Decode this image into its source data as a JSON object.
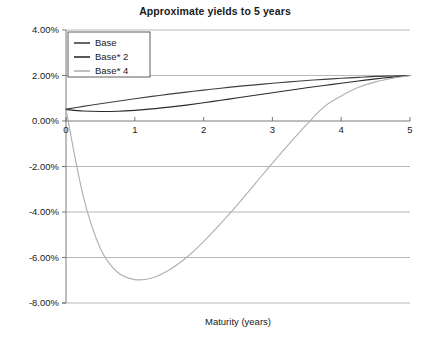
{
  "chart_data": {
    "type": "line",
    "title": "Approximate yields to 5 years",
    "xlabel": "Maturity (years)",
    "ylabel": "",
    "xlim": [
      0,
      5
    ],
    "ylim": [
      -0.08,
      0.04
    ],
    "grid": true,
    "legend_position": "top-left",
    "x_ticks": [
      "0",
      "1",
      "2",
      "3",
      "4",
      "5"
    ],
    "x_tick_values": [
      0,
      1,
      2,
      3,
      4,
      5
    ],
    "y_ticks": [
      "4.00%",
      "2.00%",
      "0.00%",
      "-2.00%",
      "-4.00%",
      "-6.00%",
      "-8.00%"
    ],
    "y_tick_values": [
      0.04,
      0.02,
      0.0,
      -0.02,
      -0.04,
      -0.06,
      -0.08
    ],
    "x": [
      0,
      0.25,
      0.5,
      0.75,
      1,
      1.25,
      1.5,
      1.75,
      2,
      2.25,
      2.5,
      2.75,
      3,
      3.25,
      3.5,
      3.75,
      4,
      4.25,
      4.5,
      4.75,
      5
    ],
    "series": [
      {
        "name": "Base",
        "color": "#3f3f3f",
        "values": [
          0.0052,
          0.0064,
          0.0076,
          0.0087,
          0.0098,
          0.0108,
          0.0118,
          0.0127,
          0.0136,
          0.0144,
          0.0152,
          0.0159,
          0.0166,
          0.0172,
          0.0178,
          0.0183,
          0.0188,
          0.0192,
          0.0196,
          0.0198,
          0.02
        ]
      },
      {
        "name": "Base* 2",
        "color": "#2b2b2b",
        "values": [
          0.005,
          0.0044,
          0.0042,
          0.0043,
          0.0047,
          0.0053,
          0.0061,
          0.007,
          0.008,
          0.0091,
          0.0102,
          0.0113,
          0.0124,
          0.0135,
          0.0146,
          0.0156,
          0.0166,
          0.0176,
          0.0185,
          0.0193,
          0.02
        ]
      },
      {
        "name": "Base* 4",
        "color": "#b0b0b0",
        "values": [
          0.005,
          -0.033,
          -0.056,
          -0.0665,
          -0.0697,
          -0.069,
          -0.0655,
          -0.06,
          -0.053,
          -0.045,
          -0.0365,
          -0.0275,
          -0.0185,
          -0.0098,
          -0.0015,
          0.0062,
          0.011,
          0.0148,
          0.0172,
          0.0188,
          0.02
        ]
      }
    ],
    "annotations": {
      "minimum": {
        "series": "Base* 4",
        "x": 1.15,
        "y": -0.07
      },
      "zero_crossing": {
        "series": "Base* 4",
        "x": 3.55
      },
      "convergence": {
        "x": 5,
        "y": 0.02
      }
    }
  }
}
